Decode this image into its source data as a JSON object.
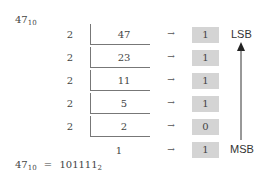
{
  "title": {
    "number": "47",
    "base": "10"
  },
  "rows": [
    {
      "divisor": "2",
      "dividend": "47",
      "remainder": "1"
    },
    {
      "divisor": "2",
      "dividend": "23",
      "remainder": "1"
    },
    {
      "divisor": "2",
      "dividend": "11",
      "remainder": "1"
    },
    {
      "divisor": "2",
      "dividend": "5",
      "remainder": "1"
    },
    {
      "divisor": "2",
      "dividend": "2",
      "remainder": "0"
    }
  ],
  "final": {
    "quotient": "1",
    "remainder": "1"
  },
  "arrow_glyph": "→",
  "labels": {
    "lsb": "LSB",
    "msb": "MSB"
  },
  "result": {
    "lhs": "47",
    "lhs_base": "10",
    "eq": "=",
    "rhs": "101111",
    "rhs_base": "2"
  },
  "colors": {
    "remainder_box": "#d4d4d4",
    "line": "#777777"
  }
}
